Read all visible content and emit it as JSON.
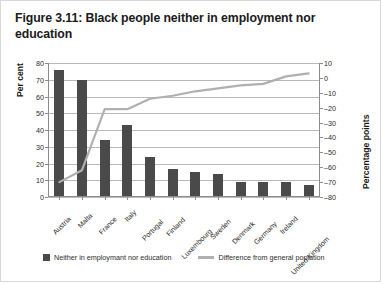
{
  "figure": {
    "title": "Figure 3.11: Black people neither in employment nor education",
    "border_color": "#d8d8d8",
    "background": "#ffffff"
  },
  "legend": {
    "bar_label": "Neither in employmant nor education",
    "line_label": "Difference from general poplation",
    "bar_color": "#4a4a4a",
    "line_color": "#b0b0b0"
  },
  "chart_data": {
    "type": "bar",
    "title": "Figure 3.11: Black people neither in employment nor education",
    "xlabel": "",
    "ylabel": "Per cent",
    "ylabel_secondary": "Percentage points",
    "categories": [
      "Austria",
      "Malta",
      "France",
      "Italy",
      "Portugal",
      "Finland",
      "Luxembourg",
      "Sweden",
      "Denmark",
      "Germany",
      "Ireland",
      "United Kingdom"
    ],
    "series": [
      {
        "name": "Neither in employmant nor education",
        "type": "bar",
        "axis": "left",
        "color": "#4a4a4a",
        "values": [
          76,
          70,
          34,
          43,
          24,
          17,
          15,
          14,
          9,
          9,
          9,
          7
        ]
      },
      {
        "name": "Difference from general poplation",
        "type": "line",
        "axis": "right",
        "color": "#b0b0b0",
        "values": [
          -70,
          -62,
          -21,
          -21,
          -14,
          -12,
          -9,
          -7,
          -5,
          -4,
          1,
          3
        ]
      }
    ],
    "ylim": [
      0,
      80
    ],
    "yticks": [
      0,
      10,
      20,
      30,
      40,
      50,
      60,
      70,
      80
    ],
    "ylim_secondary": [
      -80,
      10
    ],
    "yticks_secondary": [
      10,
      0,
      -10,
      -20,
      -30,
      -40,
      -50,
      -60,
      -70,
      -80
    ],
    "ytick_labels_secondary": [
      "10",
      "0",
      "–10",
      "–20",
      "–30",
      "–40",
      "–50",
      "–60",
      "–70",
      "–80"
    ],
    "grid": true,
    "legend_position": "bottom"
  }
}
